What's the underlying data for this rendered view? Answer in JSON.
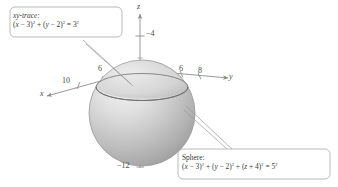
{
  "figure": {
    "type": "3d-sphere-diagram",
    "background": "#ffffff",
    "sphere_fill_light": "#e8e8e8",
    "sphere_fill_dark": "#a9a9a9",
    "axis_color": "#8c8c8c",
    "text_color": "#3a3a3a"
  },
  "axes": {
    "x_label": "x",
    "y_label": "y",
    "z_label": "z",
    "x_ticks": [
      "10",
      "6"
    ],
    "y_ticks": [
      "6",
      "8"
    ],
    "z_ticks": [
      "-4",
      "-12"
    ]
  },
  "tick_values": {
    "x_10": "10",
    "x_6": "6",
    "y_6": "6",
    "y_8": "8",
    "z_neg4": "−4",
    "z_neg12": "−12"
  },
  "callouts": {
    "trace": {
      "title": "xy-trace:",
      "equation_plain": "(x − 3)² + (y − 2)² = 3²",
      "parts": {
        "t1": "(",
        "v1": "x",
        "o1": " − 3)",
        "e1": "2",
        "o2": " + (",
        "v2": "y",
        "o3": " − 2)",
        "e2": "2",
        "o4": " = 3",
        "e3": "2"
      }
    },
    "sphere": {
      "title": "Sphere:",
      "equation_plain": "(x − 3)² + (y − 2)² + (z + 4)² = 5²",
      "parts": {
        "t1": "(",
        "v1": "x",
        "o1": " − 3)",
        "e1": "2",
        "o2": " + (",
        "v2": "y",
        "o3": " − 2)",
        "e2": "2",
        "o4": " + (",
        "v3": "z",
        "o5": " + 4)",
        "e3": "2",
        "o6": " = 5",
        "e4": "2"
      }
    }
  }
}
